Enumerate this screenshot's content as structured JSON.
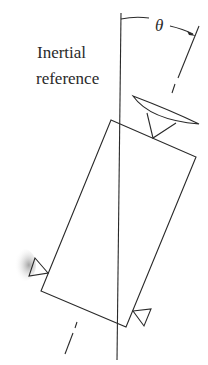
{
  "diagram": {
    "reference_label_line1": "Inertial",
    "reference_label_line2": "reference",
    "angle_label": "θ",
    "stroke_color": "#2a2a2a",
    "background": "#ffffff",
    "elements": [
      "inertial reference vertical line",
      "tilted body axis (dash-dot)",
      "tilted rectangular body",
      "antenna dish on top of body",
      "left thruster triangle with plume",
      "right thruster triangle",
      "angle arc theta between reference and body axis"
    ]
  }
}
